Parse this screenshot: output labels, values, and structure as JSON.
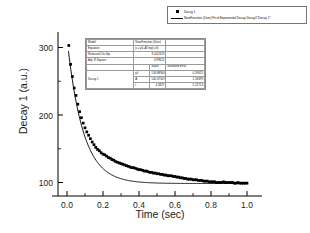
{
  "chart_data": {
    "type": "scatter",
    "title": "",
    "xlabel": "Time (sec)",
    "ylabel": "Decay 1 (a.u.)",
    "xlim": [
      -0.05,
      1.05
    ],
    "ylim": [
      80,
      320
    ],
    "xticks": [
      "0.0",
      "0.2",
      "0.4",
      "0.6",
      "0.8",
      "1.0"
    ],
    "xtick_values": [
      0.0,
      0.2,
      0.4,
      0.6,
      0.8,
      1.0
    ],
    "yticks": [
      "100",
      "200",
      "300"
    ],
    "ytick_values": [
      100,
      200,
      300
    ],
    "grid": false,
    "legend_position": "top-right",
    "series": [
      {
        "name": "Decay 1",
        "kind": "scatter",
        "marker": "square",
        "color": "#000000",
        "x": [
          0.01,
          0.02,
          0.03,
          0.04,
          0.05,
          0.06,
          0.07,
          0.08,
          0.09,
          0.1,
          0.11,
          0.12,
          0.13,
          0.14,
          0.15,
          0.16,
          0.17,
          0.18,
          0.19,
          0.2,
          0.21,
          0.22,
          0.23,
          0.24,
          0.25,
          0.26,
          0.27,
          0.28,
          0.29,
          0.3,
          0.31,
          0.32,
          0.33,
          0.34,
          0.35,
          0.36,
          0.37,
          0.38,
          0.39,
          0.4,
          0.41,
          0.42,
          0.43,
          0.44,
          0.45,
          0.46,
          0.47,
          0.48,
          0.49,
          0.5,
          0.51,
          0.52,
          0.53,
          0.54,
          0.55,
          0.56,
          0.57,
          0.58,
          0.59,
          0.6,
          0.61,
          0.62,
          0.63,
          0.64,
          0.65,
          0.66,
          0.67,
          0.68,
          0.69,
          0.7,
          0.71,
          0.72,
          0.73,
          0.74,
          0.75,
          0.76,
          0.77,
          0.78,
          0.79,
          0.8,
          0.81,
          0.82,
          0.83,
          0.84,
          0.85,
          0.86,
          0.87,
          0.88,
          0.89,
          0.9,
          0.91,
          0.92,
          0.93,
          0.94,
          0.95,
          0.96,
          0.97,
          0.98,
          0.99,
          1.0
        ],
        "y": [
          303,
          275,
          257,
          240,
          229,
          216,
          205,
          196,
          188,
          181,
          175,
          170,
          165,
          160,
          156,
          152,
          149,
          147,
          144,
          142,
          141,
          139,
          137,
          136,
          134,
          133,
          131,
          130,
          129,
          128,
          127,
          126,
          125,
          124,
          123,
          122,
          122,
          121,
          120,
          119,
          119,
          118,
          117,
          117,
          116,
          115,
          115,
          114,
          114,
          113,
          113,
          112,
          112,
          111,
          111,
          110,
          110,
          110,
          109,
          109,
          108,
          108,
          107,
          107,
          106,
          106,
          105,
          105,
          105,
          104,
          104,
          104,
          103,
          103,
          103,
          102,
          102,
          102,
          101,
          101,
          101,
          101,
          100,
          100,
          100,
          100,
          101,
          100,
          100,
          100,
          100,
          100,
          99,
          99,
          100,
          99,
          99,
          99,
          99,
          99
        ]
      },
      {
        "name": "NewFunction (User) Fit of Exponential Decay Decay1\"Decay 1\"",
        "kind": "line",
        "color": "#000000"
      }
    ]
  },
  "legend": {
    "entries": [
      {
        "label": "Decay 1",
        "symbol": "square"
      },
      {
        "label": "NewFunction (User) Fit of Exponential Decay Decay1\"Decay 1\"",
        "symbol": "line"
      }
    ]
  },
  "fit_table": {
    "rows": [
      {
        "label": "Model",
        "value": "NewFunction (User)",
        "v2": "",
        "v3": ""
      },
      {
        "label": "Equation",
        "value": "y = y0+A*exp(-x/t)",
        "v2": "",
        "v3": ""
      },
      {
        "label": "Reduced Chi-Sqr",
        "value": "3.4.62419",
        "v2": "",
        "v3": ""
      },
      {
        "label": "Adj. R-Square",
        "value": "0.99615",
        "v2": "",
        "v3": ""
      }
    ],
    "header": {
      "blank": "",
      "param": "",
      "value": "Value",
      "error": "Standard Error"
    },
    "params": [
      {
        "series": "Decay 1",
        "name": "y0",
        "value": "134.88940",
        "error": "0.59625"
      },
      {
        "series": "",
        "name": "A",
        "value": "140.37307",
        "error": "1.18499"
      },
      {
        "series": "",
        "name": "t",
        "value": "4.3827",
        "error": "5.21714"
      }
    ]
  },
  "colors": {
    "background": "#ffffff",
    "axis": "#000000",
    "data": "#000000",
    "table_border": "#8a8a8a"
  }
}
